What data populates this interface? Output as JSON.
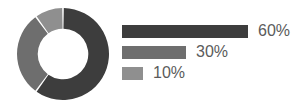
{
  "chart_data": {
    "type": "pie",
    "variant": "donut",
    "title": "",
    "subtitle": "",
    "xlabel": "",
    "ylabel": "",
    "grid": false,
    "legend_position": "right",
    "start_angle_deg": 0,
    "direction": "clockwise",
    "hole_ratio": 0.55,
    "slice_gap_deg": 2,
    "labels": [
      "60%",
      "30%",
      "10%"
    ],
    "values": [
      60,
      30,
      10
    ],
    "value_labels": [
      "60%",
      "30%",
      "10%"
    ],
    "colors": [
      "#3d3d3d",
      "#6e6e6e",
      "#8f8f8f"
    ],
    "background": "#ffffff",
    "text_color": "#5b5b5b"
  },
  "legend": {
    "items": [
      {
        "value_label": "60%",
        "color": "#3d3d3d",
        "bar_width": 126
      },
      {
        "value_label": "30%",
        "color": "#6e6e6e",
        "bar_width": 64
      },
      {
        "value_label": "10%",
        "color": "#8f8f8f",
        "bar_width": 21
      }
    ]
  }
}
